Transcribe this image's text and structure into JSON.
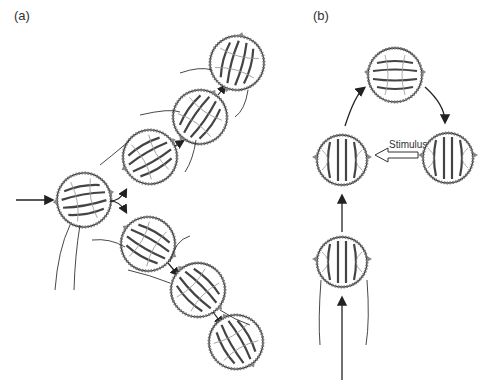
{
  "panels": [
    {
      "label": "(a)",
      "description": "Ctenophore larva swimming forward then turning, path branches into upper and lower trajectories"
    },
    {
      "label": "(b)",
      "description": "Ctenophore larva moving upward, circling; stimulus applied from the right"
    }
  ],
  "annotations": {
    "stimulus": "Stimulus"
  },
  "icons": {
    "organism": "ctenophore-icon",
    "arrow": "arrow-icon"
  },
  "colors": {
    "line": "#222222",
    "shade": "#888888",
    "background": "#ffffff"
  }
}
